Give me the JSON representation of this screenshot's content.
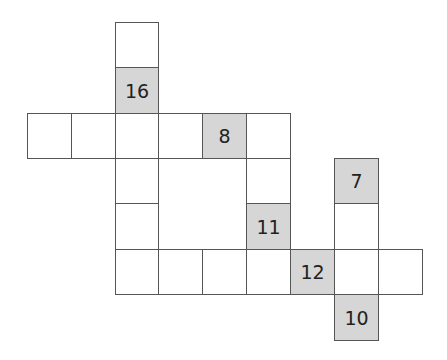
{
  "puzzle": {
    "type": "number-crossword",
    "colors": {
      "cell_fill": "#ffffff",
      "clue_fill": "#d6d6d6",
      "border": "#555555",
      "text": "#222222"
    },
    "geometry": {
      "col_x": [
        27,
        71,
        115,
        158,
        202,
        246,
        290,
        334,
        378,
        422
      ],
      "row_y": [
        22,
        67,
        113,
        158,
        203,
        249,
        294,
        340
      ]
    },
    "cells": [
      {
        "row": 0,
        "col": 2,
        "shaded": false,
        "value": ""
      },
      {
        "row": 1,
        "col": 2,
        "shaded": true,
        "value": "16"
      },
      {
        "row": 2,
        "col": 0,
        "shaded": false,
        "value": ""
      },
      {
        "row": 2,
        "col": 1,
        "shaded": false,
        "value": ""
      },
      {
        "row": 2,
        "col": 2,
        "shaded": false,
        "value": ""
      },
      {
        "row": 2,
        "col": 3,
        "shaded": false,
        "value": ""
      },
      {
        "row": 2,
        "col": 4,
        "shaded": true,
        "value": "8"
      },
      {
        "row": 2,
        "col": 5,
        "shaded": false,
        "value": ""
      },
      {
        "row": 3,
        "col": 2,
        "shaded": false,
        "value": ""
      },
      {
        "row": 3,
        "col": 5,
        "shaded": false,
        "value": ""
      },
      {
        "row": 3,
        "col": 7,
        "shaded": true,
        "value": "7"
      },
      {
        "row": 4,
        "col": 2,
        "shaded": false,
        "value": ""
      },
      {
        "row": 4,
        "col": 5,
        "shaded": true,
        "value": "11"
      },
      {
        "row": 4,
        "col": 7,
        "shaded": false,
        "value": ""
      },
      {
        "row": 5,
        "col": 2,
        "shaded": false,
        "value": ""
      },
      {
        "row": 5,
        "col": 3,
        "shaded": false,
        "value": ""
      },
      {
        "row": 5,
        "col": 4,
        "shaded": false,
        "value": ""
      },
      {
        "row": 5,
        "col": 5,
        "shaded": false,
        "value": ""
      },
      {
        "row": 5,
        "col": 6,
        "shaded": true,
        "value": "12"
      },
      {
        "row": 5,
        "col": 7,
        "shaded": false,
        "value": ""
      },
      {
        "row": 5,
        "col": 8,
        "shaded": false,
        "value": ""
      },
      {
        "row": 6,
        "col": 7,
        "shaded": true,
        "value": "10"
      }
    ]
  }
}
